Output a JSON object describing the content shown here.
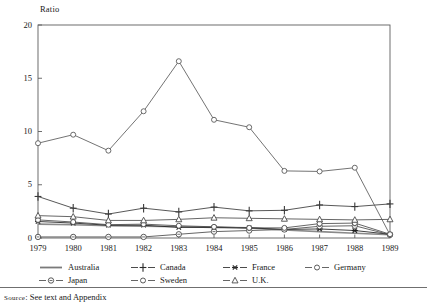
{
  "figure": {
    "y_axis_title": "Ratio",
    "source_prefix": "Source",
    "source_text": ": See text and Appendix"
  },
  "legend": {
    "rows": [
      [
        {
          "label": "Australia",
          "marker": "none",
          "color": "#7a7a7a"
        },
        {
          "label": "Canada",
          "marker": "plus",
          "color": "#2a2a2a"
        },
        {
          "label": "France",
          "marker": "asterisk",
          "color": "#2a2a2a"
        },
        {
          "label": "Germany",
          "marker": "circle",
          "color": "#4a4a4a"
        }
      ],
      [
        {
          "label": "Japan",
          "marker": "circle-dot",
          "color": "#4a4a4a"
        },
        {
          "label": "Sweden",
          "marker": "circle",
          "color": "#4a4a4a"
        },
        {
          "label": "U.K.",
          "marker": "triangle",
          "color": "#4a4a4a"
        }
      ]
    ]
  },
  "chart_data": {
    "type": "line",
    "title": "",
    "xlabel": "",
    "ylabel": "Ratio",
    "ylim": [
      0,
      20
    ],
    "yticks": [
      0,
      5,
      10,
      15,
      20
    ],
    "xlim": [
      1979,
      1989
    ],
    "grid": false,
    "legend_position": "below",
    "categories": [
      1979,
      1980,
      1981,
      1982,
      1983,
      1984,
      1985,
      1986,
      1987,
      1988,
      1989
    ],
    "x_tick_labels": [
      "1979",
      "1980",
      "1981",
      "1982",
      "1983",
      "1984",
      "1985",
      "1986",
      "1987",
      "1988",
      "1989"
    ],
    "series": [
      {
        "name": "Australia",
        "marker": "none",
        "color": "#8a8a8a",
        "values": [
          1.3,
          1.25,
          1.15,
          1.1,
          1.05,
          1.0,
          0.95,
          0.75,
          0.6,
          0.45,
          0.3
        ]
      },
      {
        "name": "Canada",
        "marker": "plus",
        "color": "#3a3a3a",
        "values": [
          3.9,
          2.8,
          2.25,
          2.8,
          2.45,
          2.9,
          2.55,
          2.6,
          3.1,
          2.95,
          3.2
        ]
      },
      {
        "name": "France",
        "marker": "asterisk",
        "color": "#1f1f1f",
        "values": [
          1.55,
          1.4,
          1.2,
          1.2,
          1.0,
          1.0,
          0.95,
          0.8,
          0.85,
          0.7,
          0.35
        ]
      },
      {
        "name": "Germany",
        "marker": "circle",
        "color": "#5a5a5a",
        "values": [
          8.9,
          9.7,
          8.2,
          11.9,
          16.6,
          11.1,
          10.4,
          6.3,
          6.25,
          6.6,
          0.3
        ]
      },
      {
        "name": "Japan",
        "marker": "circle-dot",
        "color": "#4a4a4a",
        "values": [
          0.1,
          0.1,
          0.1,
          0.1,
          0.35,
          0.6,
          0.7,
          0.8,
          1.1,
          1.15,
          0.3
        ]
      },
      {
        "name": "Sweden",
        "marker": "circle",
        "color": "#4a4a4a",
        "values": [
          1.7,
          1.5,
          1.25,
          1.3,
          1.15,
          1.05,
          0.95,
          0.95,
          1.35,
          1.4,
          0.35
        ]
      },
      {
        "name": "U.K.",
        "marker": "triangle",
        "color": "#4a4a4a",
        "values": [
          2.1,
          2.0,
          1.65,
          1.65,
          1.75,
          1.9,
          1.85,
          1.8,
          1.75,
          1.7,
          1.75
        ]
      }
    ]
  }
}
